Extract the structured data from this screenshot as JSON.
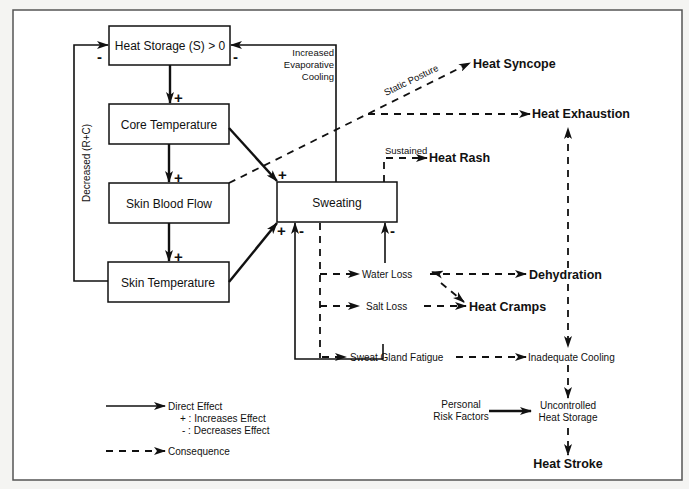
{
  "diagram": {
    "nodes": {
      "heat_storage": "Heat Storage (S) > 0",
      "core_temperature": "Core Temperature",
      "skin_blood_flow": "Skin Blood Flow",
      "skin_temperature": "Skin Temperature",
      "sweating": "Sweating",
      "heat_syncope": "Heat Syncope",
      "heat_exhaustion": "Heat Exhaustion",
      "heat_rash": "Heat Rash",
      "water_loss": "Water Loss",
      "salt_loss": "Salt Loss",
      "dehydration": "Dehydration",
      "heat_cramps": "Heat Cramps",
      "sweat_gland_fatigue": "Sweat Gland Fatigue",
      "inadequate_cooling": "Inadequate Cooling",
      "personal_risk_line1": "Personal",
      "personal_risk_line2": "Risk Factors",
      "uncontrolled_line1": "Uncontrolled",
      "uncontrolled_line2": "Heat Storage",
      "heat_stroke": "Heat Stroke"
    },
    "edge_labels": {
      "decreased_rc": "Decreased (R+C)",
      "increased_line1": "Increased",
      "increased_line2": "Evaporative",
      "increased_line3": "Cooling",
      "static_posture": "Static Posture",
      "sustained": "Sustained"
    },
    "signs": {
      "plus": "+",
      "minus": "-"
    },
    "legend": {
      "direct_effect": "Direct Effect",
      "increases": "+ :  Increases Effect",
      "decreases": "- :  Decreases Effect",
      "consequence": "Consequence"
    }
  }
}
